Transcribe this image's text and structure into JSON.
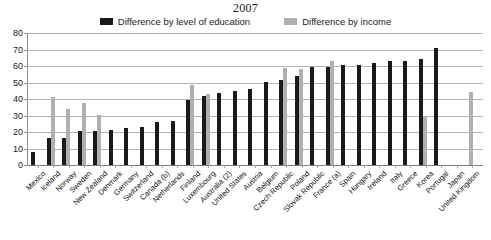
{
  "chart_data": {
    "type": "bar",
    "title": "2007",
    "xlabel": "",
    "ylabel": "",
    "ylim": [
      0,
      80
    ],
    "yticks": [
      0,
      10,
      20,
      30,
      40,
      50,
      60,
      70,
      80
    ],
    "grid": true,
    "legend_position": "top-center",
    "categories": [
      "Mexico",
      "Iceland",
      "Norway",
      "Sweden",
      "New Zealand",
      "Denmark",
      "Germany",
      "Switzerland",
      "Canada (b)",
      "Netherlands",
      "Finland",
      "Luxembourg",
      "Australia (2)",
      "United States",
      "Austria",
      "Belgium",
      "Czech Republic",
      "Poland",
      "Slovak Republic",
      "France (a)",
      "Spain",
      "Hungary",
      "Ireland",
      "Italy",
      "Greece",
      "Korea",
      "Portugal",
      "Japan",
      "United Kingdom"
    ],
    "series": [
      {
        "name": "Difference by level of education",
        "color": "#1a1a1a",
        "values": [
          8.0,
          16.5,
          16.6,
          20.6,
          20.6,
          21.4,
          22.5,
          23.0,
          26.0,
          26.5,
          39.4,
          41.8,
          43.7,
          44.6,
          45.9,
          50.1,
          51.6,
          53.8,
          59.4,
          59.7,
          60.6,
          60.6,
          62.1,
          63.3,
          71.0,
          null,
          null,
          null,
          null
        ]
      },
      {
        "name": "Difference by income",
        "color": "#b0b0b0",
        "values": [
          null,
          41.0,
          34.0,
          37.5,
          30.5,
          null,
          null,
          null,
          null,
          48.5,
          42.8,
          null,
          null,
          null,
          null,
          58.5,
          58.0,
          null,
          null,
          null,
          63.3,
          null,
          null,
          null,
          null,
          null,
          30.0,
          44.0,
          null
        ]
      }
    ],
    "note": "series values are aligned to categories by index; nulls are absent bars"
  },
  "legend": {
    "items": [
      {
        "label": "Difference by level of education",
        "color": "#1a1a1a",
        "key": "education"
      },
      {
        "label": "Difference by income",
        "color": "#b0b0b0",
        "key": "income"
      }
    ]
  },
  "bars": [
    {
      "category": "Mexico",
      "education": 8.0,
      "income": null
    },
    {
      "category": "Iceland",
      "education": 16.5,
      "income": 41.0
    },
    {
      "category": "Norway",
      "education": 16.6,
      "income": 34.0
    },
    {
      "category": "Sweden",
      "education": 20.6,
      "income": 37.5
    },
    {
      "category": "New Zealand",
      "education": 20.6,
      "income": 30.5
    },
    {
      "category": "Denmark",
      "education": 21.4,
      "income": null
    },
    {
      "category": "Germany",
      "education": 22.5,
      "income": null
    },
    {
      "category": "Switzerland",
      "education": 23.0,
      "income": null
    },
    {
      "category": "Canada (b)",
      "education": 26.0,
      "income": null
    },
    {
      "category": "Netherlands",
      "education": 26.5,
      "income": null
    },
    {
      "category": "Finland",
      "education": 39.4,
      "income": 48.5
    },
    {
      "category": "Luxembourg",
      "education": 41.8,
      "income": 42.8
    },
    {
      "category": "Australia (2)",
      "education": 43.7,
      "income": null
    },
    {
      "category": "United States",
      "education": 44.6,
      "income": null
    },
    {
      "category": "Austria",
      "education": 45.9,
      "income": null
    },
    {
      "category": "Belgium",
      "education": 50.1,
      "income": null
    },
    {
      "category": "Czech Republic",
      "education": 51.6,
      "income": 58.5
    },
    {
      "category": "Poland",
      "education": 53.8,
      "income": 58.0
    },
    {
      "category": "Slovak Republic",
      "education": 59.4,
      "income": null
    },
    {
      "category": "France (a)",
      "education": 59.7,
      "income": 63.3
    },
    {
      "category": "Spain",
      "education": 60.6,
      "income": null
    },
    {
      "category": "Hungary",
      "education": 60.6,
      "income": null
    },
    {
      "category": "Ireland",
      "education": 62.1,
      "income": null
    },
    {
      "category": "Italy",
      "education": 63.3,
      "income": null
    },
    {
      "category": "Greece",
      "education": 63.3,
      "income": null
    },
    {
      "category": "Korea",
      "education": 64.0,
      "income": 30.0
    },
    {
      "category": "Portugal",
      "education": 71.0,
      "income": null
    },
    {
      "category": "Japan",
      "education": null,
      "income": null
    },
    {
      "category": "United Kingdom",
      "education": null,
      "income": 44.0
    }
  ],
  "axis": {
    "y_ticks": [
      "0",
      "10",
      "20",
      "30",
      "40",
      "50",
      "60",
      "70",
      "80"
    ],
    "y_min": 0,
    "y_max": 80
  },
  "colors": {
    "education_bar": "#1a1a1a",
    "income_bar": "#b0b0b0",
    "gridline": "#b3b3b3",
    "axis": "#8c8c8c",
    "background": "#ffffff",
    "text": "#1a1a1a"
  }
}
